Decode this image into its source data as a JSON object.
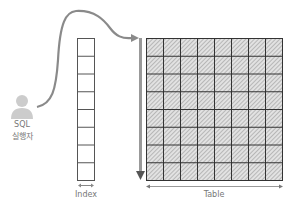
{
  "actor": {
    "line1": "SQL",
    "line2": "실행자",
    "icon": "person-icon",
    "color": "#c8c8c8"
  },
  "index": {
    "label": "Index",
    "rows": 8,
    "columns": 1,
    "border_color": "#555555"
  },
  "table": {
    "label": "Table",
    "rows": 8,
    "columns": 8,
    "fill": "hatched",
    "border_color": "#333333"
  },
  "arrows": {
    "access_path": "curved-arrow-to-table",
    "scan_direction": "vertical-arrow-down",
    "color": "#888888"
  }
}
